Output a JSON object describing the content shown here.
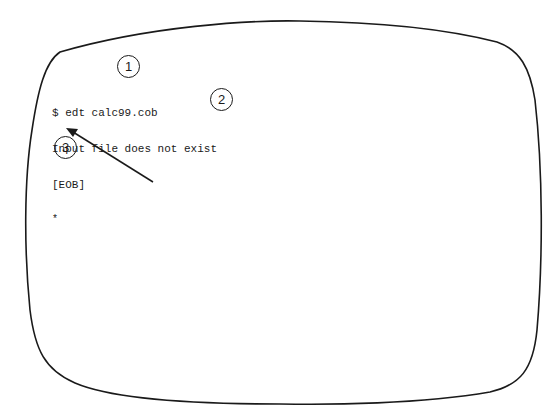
{
  "figure": {
    "screen_frame": {
      "shape": "crt-rounded-rectangle",
      "stroke_color": "#1a1a1a"
    },
    "terminal": {
      "lines": [
        "$ edt calc99.cob",
        "Input file does not exist",
        "[EOB]"
      ],
      "prompt": "*"
    },
    "callouts": [
      {
        "number": "1",
        "target": "command-line"
      },
      {
        "number": "2",
        "target": "message-line"
      },
      {
        "number": "3",
        "target": "prompt"
      }
    ],
    "arrow": {
      "icon": "arrow-icon",
      "points_to": "prompt"
    },
    "caption": {
      "visible": "truncated"
    }
  }
}
